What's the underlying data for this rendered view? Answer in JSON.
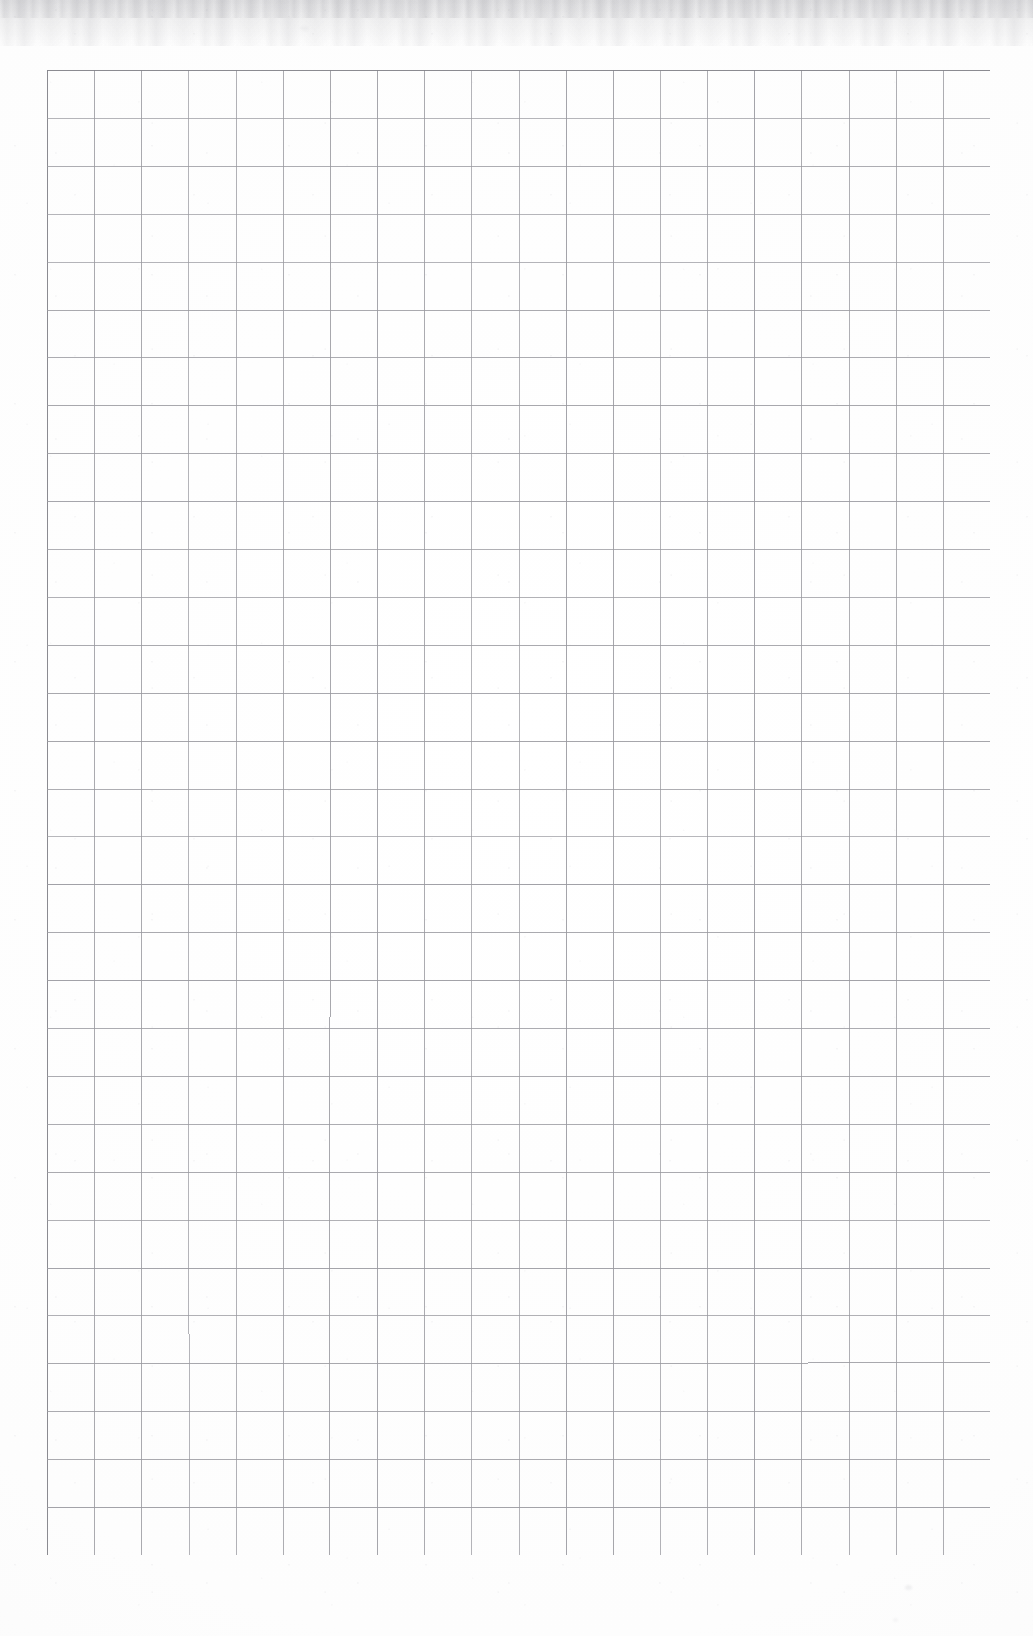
{
  "document": {
    "kind": "scanned-grid-paper",
    "title": "Blank Graph Paper Sheet",
    "page_width": 1033,
    "page_height": 1636,
    "background_color": "#fefefe",
    "has_text_content": false,
    "visible_text": "",
    "notes_label": ""
  },
  "grid": {
    "label": "Square Grid",
    "origin_x": 47,
    "origin_y": 70,
    "width": 943,
    "height": 1485,
    "columns": 20,
    "rows": 31,
    "cell_width": 47.2,
    "cell_height": 47.9,
    "line_color": "#9a9aa0",
    "border_color": "#85858c",
    "line_width": 1,
    "border_width": 1.2,
    "style": "square"
  },
  "artifacts": {
    "scan_band_label": "top scan shadow band",
    "scan_band_color": "#91919a",
    "speckle_label": "paper speckle noise",
    "speckle_color": "#a5a5ac",
    "margin_label": "blank paper margin",
    "margins": {
      "left": 47,
      "top": 70,
      "right": 43,
      "bottom": 81
    }
  },
  "chart_data": {
    "type": "table",
    "title": "",
    "xlabel": "",
    "ylabel": "",
    "categories": [],
    "values": [],
    "grid": true,
    "legend": "none"
  }
}
